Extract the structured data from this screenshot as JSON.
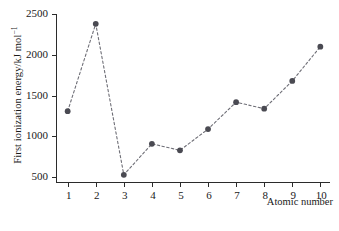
{
  "chart_data": {
    "type": "line",
    "title": "",
    "subtitle": "",
    "xlabel": "Atomic number",
    "ylabel": "First ionization energy/kJ mol",
    "ylabel_superscript": "−1",
    "x": [
      1,
      2,
      3,
      4,
      5,
      6,
      7,
      8,
      9,
      10
    ],
    "values": [
      1310,
      2380,
      530,
      910,
      830,
      1090,
      1420,
      1340,
      1680,
      2100
    ],
    "series": [
      {
        "name": "First ionization energy",
        "values": [
          1310,
          2380,
          530,
          910,
          830,
          1090,
          1420,
          1340,
          1680,
          2100
        ]
      }
    ],
    "xlim": [
      0.62,
      10.38
    ],
    "ylim": [
      430,
      2500
    ],
    "xticks": [
      1,
      2,
      3,
      4,
      5,
      6,
      7,
      8,
      9,
      10
    ],
    "xtick_labels": [
      "1",
      "2",
      "3",
      "4",
      "5",
      "6",
      "7",
      "8",
      "9",
      "10"
    ],
    "yticks": [
      500,
      1000,
      1500,
      2000,
      2500
    ],
    "ytick_labels": [
      "500",
      "1000",
      "1500",
      "2000",
      "2500"
    ],
    "grid": false,
    "legend": null,
    "legend_position": "none",
    "marker": "circle",
    "marker_color": "#4a4a52",
    "line_style": "dashed",
    "line_color": "#6e6e76",
    "axis_color": "#2b2b2b",
    "background_color": "#ffffff",
    "annotations": []
  },
  "caption": {
    "text": ""
  }
}
